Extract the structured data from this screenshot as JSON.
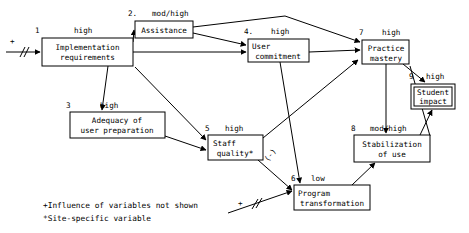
{
  "diagram": {
    "title_hidden": "",
    "nodes": [
      {
        "id": "implementation_requirements",
        "number": "1",
        "strength": "high",
        "line1": "Implementation",
        "line2": "requirements",
        "double_border": false
      },
      {
        "id": "assistance",
        "number": "2.",
        "strength": "mod/high",
        "line1": "Assistance",
        "line2": "",
        "double_border": false
      },
      {
        "id": "adequacy_of_user_preparation",
        "number": "3",
        "strength": "high",
        "line1": "Adequacy of",
        "line2": "user preparation",
        "double_border": false
      },
      {
        "id": "user_commitment",
        "number": "4.",
        "strength": "high",
        "line1": "User",
        "line2": "commitment",
        "double_border": false
      },
      {
        "id": "staff_quality",
        "number": "5",
        "strength": "high",
        "line1": "Staff",
        "line2": "quality*",
        "double_border": false
      },
      {
        "id": "program_transformation",
        "number": "6",
        "strength": "low",
        "line1": "Program",
        "line2": "transformation",
        "double_border": false
      },
      {
        "id": "practice_mastery",
        "number": "7",
        "strength": "high",
        "line1": "Practice",
        "line2": "mastery",
        "double_border": false
      },
      {
        "id": "stabilization_of_use",
        "number": "8",
        "strength": "mod/high",
        "line1": "Stabilization",
        "line2": "of use",
        "double_border": false
      },
      {
        "id": "student_impact",
        "number": "9",
        "strength": "high",
        "line1": "Student",
        "line2": "impact",
        "double_border": true
      }
    ],
    "edge_labels": [
      {
        "id": "staff-quality-to-program-transformation-sign",
        "text": "(-)"
      }
    ],
    "external_inputs": [
      {
        "id": "input-to-implementation-requirements",
        "sign": "+"
      },
      {
        "id": "input-to-program-transformation",
        "sign": "+"
      }
    ],
    "legend": [
      {
        "id": "legend-plus",
        "text": "+Influence of variables not shown"
      },
      {
        "id": "legend-asterisk",
        "text": "*Site-specific variable"
      }
    ]
  }
}
